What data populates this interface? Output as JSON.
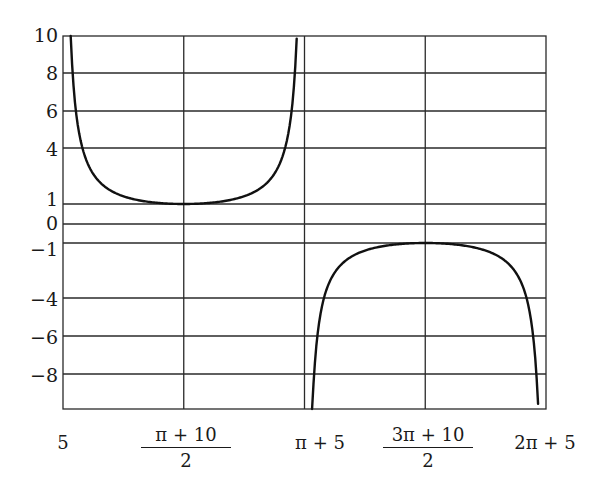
{
  "chart_data": {
    "type": "line",
    "title": "",
    "xlabel": "",
    "ylabel": "",
    "function": "y = csc(x - 5)",
    "x_ticks": [
      "5",
      "(π + 10)/2",
      "π + 5",
      "(3π + 10)/2",
      "2π + 5"
    ],
    "x_tick_values": [
      5,
      6.5708,
      8.1416,
      9.7124,
      11.2832
    ],
    "y_ticks": [
      "10",
      "8",
      "6",
      "4",
      "1",
      "0",
      "-1",
      "-4",
      "-6",
      "-8"
    ],
    "y_tick_values": [
      10,
      8,
      6,
      4,
      1,
      0,
      -1,
      -4,
      -6,
      -8
    ],
    "xlim": [
      5,
      11.2832
    ],
    "ylim": [
      -10,
      10
    ],
    "grid": true,
    "series": [
      {
        "name": "upper branch",
        "x": [
          5.1,
          5.13,
          5.17,
          5.25,
          5.35,
          5.5,
          5.7,
          6.0,
          6.3,
          6.5708,
          6.85,
          7.14,
          7.44,
          7.64,
          7.79,
          7.89,
          7.97,
          8.01,
          8.04
        ],
        "y": [
          10.0,
          7.7,
          5.9,
          4.0,
          2.9,
          2.1,
          1.6,
          1.2,
          1.04,
          1.0,
          1.04,
          1.2,
          1.6,
          2.1,
          2.9,
          4.0,
          5.9,
          7.7,
          10.0
        ]
      },
      {
        "name": "lower branch",
        "x": [
          8.24,
          8.27,
          8.31,
          8.39,
          8.49,
          8.64,
          8.84,
          9.14,
          9.44,
          9.7124,
          9.99,
          10.28,
          10.58,
          10.78,
          10.93,
          11.03,
          11.11,
          11.15,
          11.18
        ],
        "y": [
          -10.0,
          -7.7,
          -5.9,
          -4.0,
          -2.9,
          -2.1,
          -1.6,
          -1.2,
          -1.04,
          -1.0,
          -1.04,
          -1.2,
          -1.6,
          -2.1,
          -2.9,
          -4.0,
          -5.9,
          -7.7,
          -10.0
        ]
      }
    ],
    "colors": {
      "curve": "#111111",
      "grid": "#2a2a2a",
      "background": "#ffffff"
    }
  },
  "axis": {
    "y_labels": [
      "10",
      "8",
      "6",
      "4",
      "1",
      "0",
      "−1",
      "−4",
      "−6",
      "−8"
    ],
    "x_labels": {
      "x0": "5",
      "x1_num": "π + 10",
      "x1_den": "2",
      "x2": "π + 5",
      "x3_num": "3π + 10",
      "x3_den": "2",
      "x4": "2π + 5"
    }
  }
}
